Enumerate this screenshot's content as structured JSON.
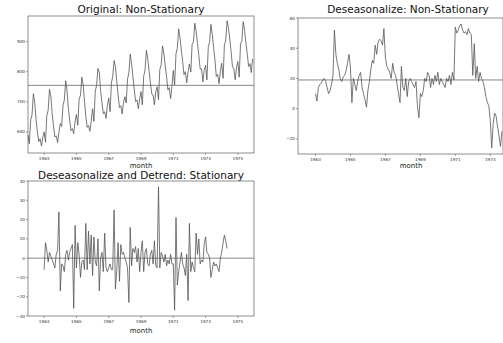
{
  "chart_data": [
    {
      "type": "line",
      "title": "Original: Non-Stationary",
      "xlabel": "month",
      "ylabel": "",
      "x_ticks": [
        "1963",
        "1965",
        "1967",
        "1969",
        "1971",
        "1973",
        "1975"
      ],
      "y_ticks": [
        600,
        700,
        800,
        900
      ],
      "ylim": [
        530,
        985
      ],
      "xlim": [
        1962.0,
        1976.0
      ],
      "grid": false,
      "hline": {
        "y": 754.7,
        "label": "mean"
      },
      "x_start": 1962.0,
      "x_step": 0.08333,
      "values": [
        589,
        561,
        640,
        656,
        727,
        697,
        640,
        599,
        568,
        577,
        553,
        582,
        600,
        566,
        653,
        673,
        742,
        716,
        660,
        617,
        583,
        587,
        565,
        598,
        628,
        618,
        688,
        705,
        770,
        736,
        678,
        639,
        604,
        611,
        594,
        634,
        658,
        622,
        709,
        722,
        782,
        756,
        702,
        653,
        615,
        621,
        602,
        635,
        677,
        635,
        736,
        755,
        811,
        798,
        735,
        697,
        661,
        667,
        645,
        688,
        713,
        667,
        762,
        784,
        837,
        817,
        767,
        722,
        681,
        687,
        660,
        698,
        717,
        696,
        775,
        796,
        858,
        826,
        783,
        740,
        701,
        706,
        677,
        711,
        734,
        690,
        785,
        805,
        871,
        845,
        801,
        764,
        725,
        723,
        690,
        734,
        750,
        707,
        807,
        824,
        886,
        859,
        819,
        783,
        740,
        747,
        711,
        751,
        804,
        756,
        860,
        878,
        942,
        913,
        869,
        834,
        790,
        800,
        763,
        800,
        826,
        799,
        890,
        900,
        961,
        935,
        894,
        855,
        809,
        810,
        766,
        805,
        821,
        773,
        883,
        898,
        957,
        924,
        881,
        837,
        784,
        791,
        760,
        802,
        828,
        778,
        889,
        902,
        969,
        947,
        908,
        867,
        815,
        812,
        773,
        813,
        834,
        782,
        892,
        903,
        966,
        937,
        896,
        858,
        817,
        827,
        797,
        843
      ]
    },
    {
      "type": "line",
      "title": "Deseasonalize: Non-Stationary",
      "xlabel": "month",
      "ylabel": "",
      "x_ticks": [
        "1963",
        "1965",
        "1967",
        "1969",
        "1971",
        "1973"
      ],
      "y_ticks": [
        -20,
        0,
        20,
        40,
        60
      ],
      "ylim": [
        -30,
        60
      ],
      "xlim": [
        1962.0,
        1974.7
      ],
      "grid": false,
      "hline": {
        "y": 19,
        "label": "mean"
      },
      "x_start": 1963.0,
      "x_step": 0.08333,
      "values": [
        10,
        5,
        14,
        16,
        17,
        19,
        20,
        18,
        14,
        10,
        12,
        16,
        22,
        52,
        36,
        30,
        26,
        20,
        18,
        21,
        22,
        25,
        30,
        36,
        28,
        4,
        20,
        16,
        12,
        18,
        22,
        24,
        14,
        10,
        6,
        1,
        12,
        18,
        26,
        32,
        30,
        42,
        36,
        44,
        46,
        45,
        42,
        53,
        34,
        28,
        26,
        24,
        20,
        30,
        24,
        22,
        16,
        10,
        4,
        28,
        14,
        12,
        20,
        8,
        18,
        20,
        18,
        16,
        14,
        18,
        2,
        -6,
        10,
        8,
        12,
        20,
        18,
        24,
        22,
        14,
        20,
        16,
        22,
        18,
        24,
        16,
        20,
        18,
        16,
        14,
        20,
        18,
        22,
        16,
        24,
        19,
        54,
        50,
        52,
        55,
        56,
        52,
        50,
        51,
        49,
        53,
        50,
        49,
        22,
        43,
        20,
        28,
        18,
        24,
        20,
        18,
        14,
        8,
        4,
        2,
        -8,
        -26,
        -10,
        -3,
        -5,
        -12,
        -18,
        -25,
        -15,
        -5,
        -2,
        8,
        6,
        4,
        7,
        20,
        24,
        28
      ]
    },
    {
      "type": "line",
      "title": "Deseasonalize and Detrend: Stationary",
      "xlabel": "month",
      "ylabel": "",
      "x_ticks": [
        "1963",
        "1965",
        "1967",
        "1969",
        "1971",
        "1973",
        "1975"
      ],
      "y_ticks": [
        -30,
        -20,
        -10,
        0,
        10,
        20,
        30,
        40
      ],
      "ylim": [
        -30,
        40
      ],
      "xlim": [
        1962.0,
        1976.0
      ],
      "grid": false,
      "hline": {
        "y": 0,
        "label": "zero"
      },
      "x_start": 1963.0,
      "x_step": 0.08333,
      "values": [
        -6,
        8,
        4,
        -2,
        3,
        1,
        -1,
        -3,
        -5,
        2,
        4,
        24,
        -17,
        -3,
        -4,
        -7,
        2,
        4,
        -1,
        3,
        5,
        7,
        -26,
        17,
        -5,
        8,
        2,
        -10,
        -2,
        -1,
        -6,
        18,
        -6,
        14,
        -3,
        12,
        -9,
        11,
        -2,
        -4,
        10,
        -17,
        0,
        3,
        -7,
        13,
        -5,
        -7,
        -5,
        -3,
        -6,
        -6,
        25,
        -16,
        -6,
        8,
        -12,
        7,
        2,
        3,
        0,
        -2,
        -5,
        -23,
        16,
        -4,
        5,
        3,
        6,
        -2,
        5,
        -7,
        3,
        9,
        -7,
        3,
        5,
        -3,
        -4,
        2,
        4,
        -3,
        9,
        -4,
        -5,
        37,
        -5,
        3,
        1,
        -2,
        2,
        -4,
        -1,
        -3,
        2,
        -3,
        -3,
        -27,
        21,
        -14,
        -7,
        -2,
        3,
        -3,
        -5,
        -9,
        2,
        -22,
        18,
        -7,
        -2,
        -5,
        -7,
        13,
        2,
        10,
        -3,
        -1,
        -2,
        7,
        11,
        3,
        2,
        0,
        -10,
        -6,
        -2,
        -4,
        -3,
        -5,
        -7,
        0,
        3,
        8,
        12,
        9,
        5
      ]
    }
  ],
  "charts": [
    {
      "title": "Original: Non-Stationary",
      "xlabel": "month"
    },
    {
      "title": "Deseasonalize: Non-Stationary",
      "xlabel": "month"
    },
    {
      "title": "Deseasonalize and Detrend: Stationary",
      "xlabel": "month"
    }
  ],
  "colors": {
    "line": "#555555",
    "axis": "#444444",
    "hline": "#666666"
  }
}
